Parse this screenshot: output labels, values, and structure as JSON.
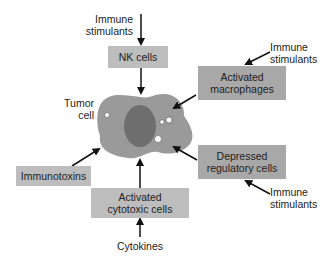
{
  "diagram": {
    "center": {
      "label_line1": "Tumor",
      "label_line2": "cell"
    },
    "nodes": {
      "nk_cells": "NK cells",
      "macrophages_line1": "Activated",
      "macrophages_line2": "macrophages",
      "regulatory_line1": "Depressed",
      "regulatory_line2": "regulatory cells",
      "cytotoxic_line1": "Activated",
      "cytotoxic_line2": "cytotoxic cells",
      "immunotoxins": "Immunotoxins"
    },
    "inputs": {
      "top_line1": "Immune",
      "top_line2": "stimulants",
      "right_top_line1": "Immune",
      "right_top_line2": "stimulants",
      "right_bottom_line1": "Immune",
      "right_bottom_line2": "stimulants",
      "bottom": "Cytokines"
    },
    "colors": {
      "box_light": "#bdbdbd",
      "box_dark": "#a8a8a8",
      "cell_body": "#9a9a9a",
      "nucleus": "#6e6e6e",
      "arrow": "#111111"
    }
  }
}
